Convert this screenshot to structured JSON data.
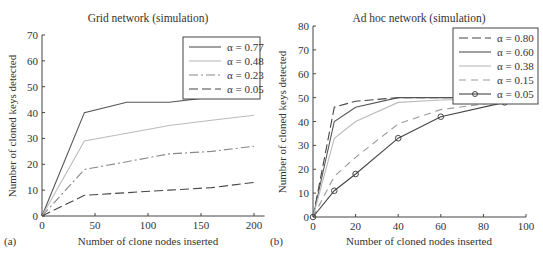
{
  "chart_data": [
    {
      "panel": "(a)",
      "type": "line",
      "title": "Grid network (simulation)",
      "xlabel": "Number of clone nodes inserted",
      "ylabel": "Number of cloned keys detected",
      "xlim": [
        0,
        210
      ],
      "ylim": [
        0,
        70
      ],
      "xticks": [
        0,
        50,
        100,
        150,
        200
      ],
      "yticks": [
        0,
        10,
        20,
        30,
        40,
        50,
        60,
        70
      ],
      "grid": false,
      "legend_position": "upper right",
      "x": [
        0,
        40,
        80,
        120,
        160,
        200
      ],
      "series": [
        {
          "name": "α = 0.77",
          "style": "solid",
          "color": "#555555",
          "values": [
            0,
            40,
            44,
            44,
            46,
            46
          ]
        },
        {
          "name": "α = 0.48",
          "style": "solid",
          "color": "#bbbbbb",
          "values": [
            0,
            29,
            32,
            35,
            37,
            39
          ]
        },
        {
          "name": "α = 0.23",
          "style": "dashdot",
          "color": "#888888",
          "values": [
            0,
            18,
            21,
            24,
            25,
            27
          ]
        },
        {
          "name": "α = 0.05",
          "style": "dashed",
          "color": "#444444",
          "values": [
            0,
            8,
            9,
            10,
            11,
            13
          ]
        }
      ]
    },
    {
      "panel": "(b)",
      "type": "line",
      "title": "Ad hoc network (simulation)",
      "xlabel": "Number of cloned nodes inserted",
      "ylabel": "Number of cloned keys detected",
      "xlim": [
        0,
        100
      ],
      "ylim": [
        0,
        80
      ],
      "xticks": [
        0,
        20,
        40,
        60,
        80,
        100
      ],
      "yticks": [
        0,
        10,
        20,
        30,
        40,
        50,
        60,
        70,
        80
      ],
      "grid": false,
      "legend_position": "upper right",
      "x": [
        0,
        10,
        20,
        40,
        60,
        90
      ],
      "series": [
        {
          "name": "α = 0.80",
          "style": "dashed",
          "color": "#444444",
          "values": [
            0,
            46,
            48.5,
            50,
            50,
            50
          ]
        },
        {
          "name": "α = 0.60",
          "style": "solid",
          "color": "#555555",
          "values": [
            0,
            40,
            46,
            50,
            50,
            50
          ]
        },
        {
          "name": "α = 0.38",
          "style": "solid",
          "color": "#bbbbbb",
          "values": [
            0,
            33,
            40,
            48,
            49,
            49.5
          ]
        },
        {
          "name": "α = 0.15",
          "style": "dashed-light",
          "color": "#999999",
          "values": [
            0,
            17,
            25,
            39,
            45,
            48.5
          ]
        },
        {
          "name": "α = 0.05",
          "style": "solid-circle",
          "color": "#444444",
          "values": [
            0,
            11,
            18,
            33,
            42,
            48
          ]
        }
      ]
    }
  ]
}
